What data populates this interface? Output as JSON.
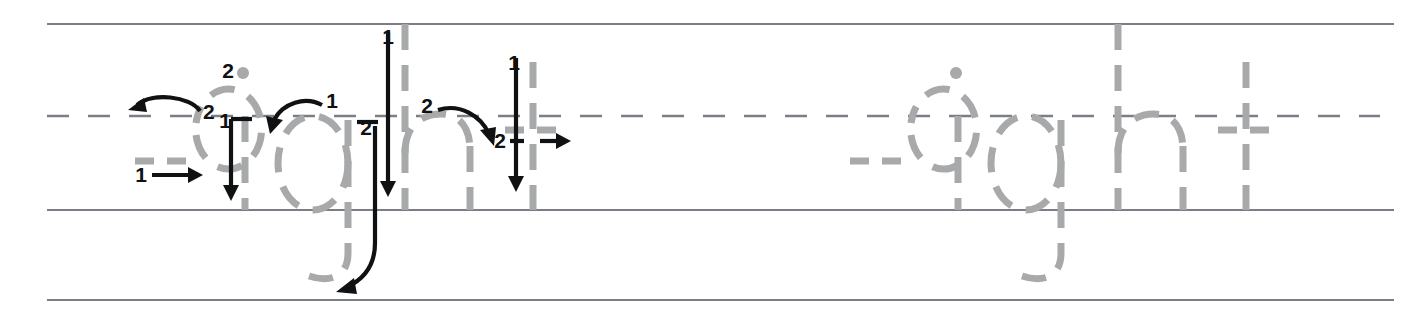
{
  "worksheet": {
    "title": "eight",
    "type": "handwriting-tracing-worksheet",
    "word": "eight",
    "letters": [
      "e",
      "i",
      "g",
      "h",
      "t"
    ],
    "rows": 1,
    "colors": {
      "rule_line": "#7b7f85",
      "guide_letter": "#a8a9ab",
      "arrow": "#101113",
      "background": "#ffffff"
    },
    "guide_rules": {
      "top_line_label": "ascender-line",
      "mid_line_label": "midline-dashed",
      "base_line_label": "baseline",
      "bottom_line_label": "descender-line"
    },
    "demo_word": {
      "label": "eight",
      "letters": [
        {
          "letter": "e",
          "strokes": [
            {
              "number": "1",
              "direction": "right",
              "description": "horizontal crossbar"
            },
            {
              "number": "2",
              "direction": "counterclockwise",
              "description": "curve around bowl"
            }
          ]
        },
        {
          "letter": "i",
          "strokes": [
            {
              "number": "1",
              "direction": "down",
              "description": "vertical stem"
            },
            {
              "number": "2",
              "direction": "dot",
              "description": "dot above stem"
            }
          ]
        },
        {
          "letter": "g",
          "strokes": [
            {
              "number": "1",
              "direction": "counterclockwise",
              "description": "bowl circle"
            },
            {
              "number": "2",
              "direction": "down-left",
              "description": "descender tail"
            }
          ]
        },
        {
          "letter": "h",
          "strokes": [
            {
              "number": "1",
              "direction": "down",
              "description": "tall vertical stem"
            },
            {
              "number": "2",
              "direction": "arch-right",
              "description": "shoulder arch and leg"
            }
          ]
        },
        {
          "letter": "t",
          "strokes": [
            {
              "number": "1",
              "direction": "down",
              "description": "vertical stem"
            },
            {
              "number": "2",
              "direction": "right",
              "description": "horizontal crossbar"
            }
          ]
        }
      ]
    },
    "trace_word": {
      "label": "eight",
      "letters": [
        "e",
        "i",
        "g",
        "h",
        "t"
      ]
    },
    "step_labels": {
      "one": "1",
      "two": "2"
    }
  }
}
